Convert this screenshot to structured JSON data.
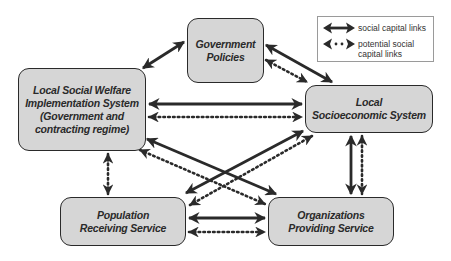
{
  "diagram": {
    "title": "",
    "nodes": {
      "government_policies": {
        "line1": "Government",
        "line2": "Policies"
      },
      "local_social_welfare": {
        "line1": "Local Social Welfare",
        "line2": "Implementation System",
        "line3": "(Government and",
        "line4": "contracting regime)"
      },
      "local_socioeconomic": {
        "line1": "Local",
        "line2": "Socioeconomic System"
      },
      "population_receiving": {
        "line1": "Population",
        "line2": "Receiving Service"
      },
      "organizations_providing": {
        "line1": "Organizations",
        "line2": "Providing Service"
      }
    },
    "legend": {
      "solid": {
        "label": "social capital links",
        "icon": "double-arrow-solid-icon"
      },
      "dotted": {
        "label_line1": "potential social",
        "label_line2": "capital links",
        "icon": "double-arrow-dotted-icon"
      }
    },
    "edges": [
      {
        "from": "local_social_welfare",
        "to": "government_policies",
        "type": "solid"
      },
      {
        "from": "government_policies",
        "to": "local_socioeconomic",
        "type": "solid"
      },
      {
        "from": "government_policies",
        "to": "local_socioeconomic",
        "type": "dotted"
      },
      {
        "from": "local_social_welfare",
        "to": "local_socioeconomic",
        "type": "solid"
      },
      {
        "from": "local_social_welfare",
        "to": "local_socioeconomic",
        "type": "dotted"
      },
      {
        "from": "local_social_welfare",
        "to": "population_receiving",
        "type": "dotted"
      },
      {
        "from": "local_social_welfare",
        "to": "organizations_providing",
        "type": "solid"
      },
      {
        "from": "local_social_welfare",
        "to": "organizations_providing",
        "type": "dotted"
      },
      {
        "from": "local_socioeconomic",
        "to": "population_receiving",
        "type": "solid"
      },
      {
        "from": "local_socioeconomic",
        "to": "population_receiving",
        "type": "dotted"
      },
      {
        "from": "local_socioeconomic",
        "to": "organizations_providing",
        "type": "solid"
      },
      {
        "from": "local_socioeconomic",
        "to": "organizations_providing",
        "type": "dotted"
      },
      {
        "from": "population_receiving",
        "to": "organizations_providing",
        "type": "solid"
      },
      {
        "from": "population_receiving",
        "to": "organizations_providing",
        "type": "dotted"
      }
    ],
    "colors": {
      "node_fill": "#d6d6d6",
      "node_border": "#2a2a2a",
      "arrow": "#2a2a2a",
      "legend_border": "#9a9a9a"
    }
  }
}
